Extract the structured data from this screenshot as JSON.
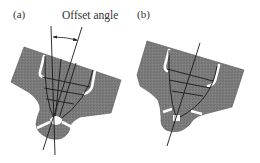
{
  "figure": {
    "panels": [
      {
        "id": "a",
        "label": "(a)"
      },
      {
        "id": "b",
        "label": "(b)"
      }
    ],
    "annotations": {
      "offset_angle": "Offset angle"
    },
    "colors": {
      "body_fill": "#7a7a7a",
      "line": "#1a1a1a",
      "gap": "#ffffff",
      "text": "#333333"
    }
  }
}
